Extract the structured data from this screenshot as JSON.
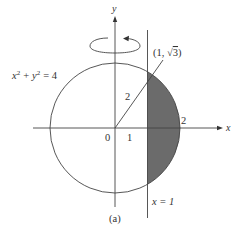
{
  "figure": {
    "caption": "(a)",
    "axes": {
      "x_label": "x",
      "y_label": "y"
    },
    "circle": {
      "equation_lhs_x": "x",
      "equation_sup_x": "2",
      "equation_plus": "+",
      "equation_lhs_y": "y",
      "equation_sup_y": "2",
      "equation_rhs": "= 4",
      "radius_label": "2"
    },
    "line": {
      "label": "x = 1"
    },
    "point": {
      "label_open": "(1, ",
      "label_sqrt": "√",
      "label_radicand": "3",
      "label_close": ")"
    },
    "ticks": {
      "origin": "0",
      "one": "1",
      "two": "2"
    },
    "rotation_indicator": "rotation-about-y-axis",
    "colors": {
      "ink": "#333333",
      "shaded_region": "#6b6b6b",
      "background": "#ffffff"
    }
  }
}
